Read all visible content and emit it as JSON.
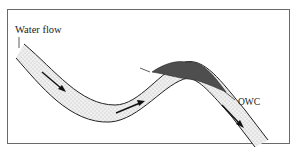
{
  "diagram": {
    "labels": {
      "water_flow": "Water flow",
      "owc": "OWC"
    },
    "colors": {
      "frame": "#6a6a6a",
      "reservoir_fill": "#e6e6e6",
      "oil_fill": "#4e4e4e",
      "line": "#222222"
    },
    "elements": [
      {
        "id": "reservoir-layer",
        "type": "stippled aquifer layer",
        "shape": "sinuous anticline"
      },
      {
        "id": "oil-accumulation",
        "type": "dark oil cap at crest of anticline"
      },
      {
        "id": "flow-arrows",
        "count": 3,
        "direction": "left-to-right down the layer"
      },
      {
        "id": "oil-water-contact",
        "label": "OWC",
        "orientation": "tilted"
      }
    ]
  }
}
